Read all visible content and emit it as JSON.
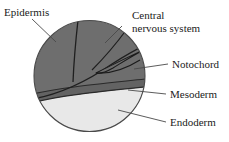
{
  "figure": {
    "shape": "circle",
    "background_color": "#ffffff",
    "outline_color": "#3a3a3a"
  },
  "regions": [
    {
      "key": "epidermis",
      "label": "Epidermis",
      "color": "#6e6e6e"
    },
    {
      "key": "central_nervous_system",
      "label_line1": "Central",
      "label_line2": "nervous system",
      "color": "#6e6e6e"
    },
    {
      "key": "notochord",
      "label": "Notochord",
      "color": "#6e6e6e"
    },
    {
      "key": "mesoderm",
      "label": "Mesoderm",
      "color": "#636363"
    },
    {
      "key": "endoderm",
      "label": "Endoderm",
      "color": "#e8e8e8"
    }
  ],
  "labels": {
    "epidermis": "Epidermis",
    "cns_line1": "Central",
    "cns_line2": "nervous system",
    "notochord": "Notochord",
    "mesoderm": "Mesoderm",
    "endoderm": "Endoderm"
  }
}
